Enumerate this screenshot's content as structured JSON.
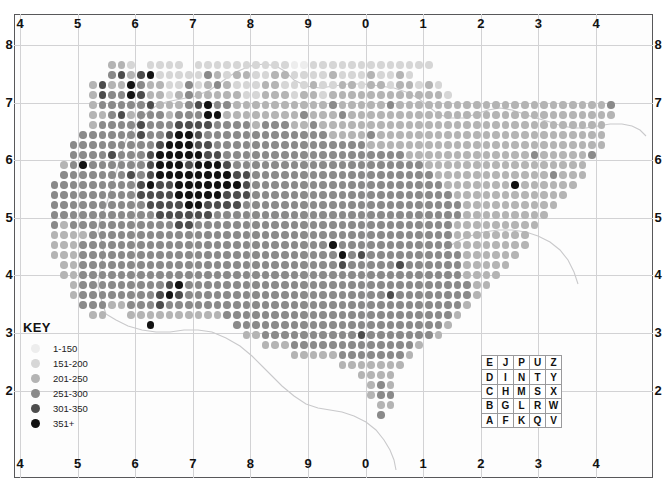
{
  "figure": {
    "background_color": "#ffffff",
    "frame_color": "#58585a",
    "gridline_color": "#d2d2d4",
    "coastline_color": "#c9c9cb"
  },
  "axes": {
    "top_labels": [
      "4",
      "5",
      "6",
      "7",
      "8",
      "9",
      "0",
      "1",
      "2",
      "3",
      "4"
    ],
    "bottom_labels": [
      "4",
      "5",
      "6",
      "7",
      "8",
      "9",
      "0",
      "1",
      "2",
      "3",
      "4"
    ],
    "left_labels": [
      "8",
      "7",
      "6",
      "5",
      "4",
      "3",
      "2"
    ],
    "right_labels": [
      "8",
      "7",
      "6",
      "5",
      "4",
      "3",
      "2"
    ],
    "x_gridline_count": 11,
    "y_gridline_count": 7
  },
  "key": {
    "title": "KEY",
    "classes": [
      {
        "label": "1-150",
        "color": "#ededed",
        "min": 1,
        "max": 150
      },
      {
        "label": "151-200",
        "color": "#d6d6d6",
        "min": 151,
        "max": 200
      },
      {
        "label": "201-250",
        "color": "#b4b4b4",
        "min": 201,
        "max": 250
      },
      {
        "label": "251-300",
        "color": "#8a8a8a",
        "min": 251,
        "max": 300
      },
      {
        "label": "301-350",
        "color": "#4d4d4d",
        "min": 301,
        "max": 350
      },
      {
        "label": "351+",
        "color": "#121212",
        "min": 351,
        "max": null
      }
    ]
  },
  "letter_grid": {
    "caption": "Ordnance Survey 100km letter grid",
    "rows": [
      [
        "E",
        "J",
        "P",
        "U",
        "Z"
      ],
      [
        "D",
        "I",
        "N",
        "T",
        "Y"
      ],
      [
        "C",
        "H",
        "M",
        "S",
        "X"
      ],
      [
        "B",
        "G",
        "L",
        "R",
        "W"
      ],
      [
        "A",
        "F",
        "K",
        "Q",
        "V"
      ]
    ]
  },
  "chart_data": {
    "type": "heatmap",
    "xlabel": "",
    "ylabel": "",
    "grid": true,
    "legend_position": "bottom-left",
    "categories": [
      "1-150",
      "151-200",
      "201-250",
      "251-300",
      "301-350",
      "351+"
    ],
    "class_colors": [
      "#ededed",
      "#d6d6d6",
      "#b4b4b4",
      "#8a8a8a",
      "#4d4d4d",
      "#121212"
    ],
    "x_tick_labels": [
      "4",
      "5",
      "6",
      "7",
      "8",
      "9",
      "0",
      "1",
      "2",
      "3",
      "4"
    ],
    "y_tick_labels": [
      "8",
      "7",
      "6",
      "5",
      "4",
      "3",
      "2"
    ],
    "cell_pitch_px": 9.6,
    "dot_diameter_px": 7.6,
    "note": "Each dot is a 10km grid square shaded by class index 0-5 (0 = 1-150 lightest, 5 = 351+ darkest). Rows are given as run-length strings: each entry is 'col:classIndex'.",
    "rows": [
      {
        "y": 51,
        "dots": "10:2 11:2 12:1 14:1 15:1 16:1 17:1 19:1 20:1 21:1 22:1 23:1 24:1 25:1 26:1 27:1 28:1 29:0 30:0 31:1 32:1 33:1 34:1 35:1 36:1 37:1 38:1 39:1 40:1 41:1 42:1 43:1"
      },
      {
        "y": 61,
        "dots": "10:3 11:4 12:2 13:4 14:5 15:1 16:1 17:1 18:1 19:1 20:3 21:2 22:1 23:2 24:2 25:1 26:1 27:2 28:2 29:1 30:1 31:1 32:1 33:2 34:1 35:1 36:1 37:2 38:1 39:1 40:2 41:1"
      },
      {
        "y": 71,
        "dots": "8:2 9:4 10:2 11:2 12:5 13:3 14:2 15:2 16:1 17:1 18:3 19:1 20:2 21:3 22:2 23:1 24:1 25:1 26:2 27:2 28:1 29:1 30:1 31:2 32:1 33:1 34:2 35:2 36:1 37:2 38:2 39:1 40:2 41:2 42:1 43:2 44:1"
      },
      {
        "y": 81,
        "dots": "8:2 9:4 10:3 11:3 12:5 13:4 14:2 15:2 16:1 17:2 18:3 19:2 20:2 21:2 22:2 23:2 24:1 25:1 26:2 27:2 28:2 29:1 30:2 31:2 32:1 33:2 34:2 35:2 36:2 37:2 38:2 39:2 40:2 41:2 42:2 43:2 44:2 45:1"
      },
      {
        "y": 91,
        "dots": "8:2 9:3 10:3 11:3 12:3 13:3 14:4 15:2 16:2 17:2 18:3 19:4 20:5 21:3 22:3 23:2 24:2 25:2 26:2 27:2 28:2 29:2 30:2 31:2 32:2 33:3 34:2 35:2 36:2 37:2 38:2 39:3 40:2 41:2 42:2 43:2 44:2 45:2 46:2 47:2 48:2 49:2 50:2 51:2 52:2 53:2 54:2 55:2 56:2 57:2 58:2 59:2 60:2 61:2 62:3"
      },
      {
        "y": 101,
        "dots": "8:2 9:2 10:3 11:4 12:2 13:3 14:3 15:3 16:2 17:3 18:3 19:3 20:5 21:5 22:2 23:2 24:2 25:2 26:2 27:2 28:2 29:2 30:3 31:2 32:2 33:2 34:3 35:2 36:2 37:2 38:2 39:2 40:2 41:2 42:2 43:2 44:2 45:2 46:2 47:2 48:2 49:2 50:2 51:2 52:2 53:2 54:2 55:2 56:2 57:2 58:2 59:2 60:2 61:2 62:2"
      },
      {
        "y": 111,
        "dots": "8:2 9:3 10:3 11:3 12:3 13:4 14:3 15:3 16:3 17:4 18:4 19:4 20:4 21:3 22:3 23:3 24:3 25:2 26:3 27:3 28:3 29:2 30:2 31:3 32:2 33:2 34:2 35:2 36:2 37:2 38:2 39:2 40:2 41:2 42:2 43:2 44:2 45:2 46:2 47:2 48:2 49:2 50:2 51:2 52:2 53:2 54:2 55:2 56:2 57:2 58:2 59:2 60:2 61:2"
      },
      {
        "y": 121,
        "dots": "7:3 8:3 9:3 10:3 11:3 12:3 13:4 14:3 15:3 16:4 17:5 18:5 19:4 20:3 21:3 22:3 23:3 24:3 25:3 26:3 27:3 28:3 29:3 30:3 31:3 32:3 33:2 34:2 35:2 36:2 37:3 38:2 39:2 40:2 41:2 42:2 43:2 44:2 45:2 46:2 47:2 48:2 49:2 50:2 51:2 52:2 53:2 54:2 55:2 56:2 57:2 58:2 59:2 60:2 61:2"
      },
      {
        "y": 131,
        "dots": "6:3 7:3 8:3 9:3 10:3 11:3 12:3 13:3 14:3 15:4 16:5 17:5 18:5 19:4 20:4 21:3 22:3 23:3 24:3 25:3 26:3 27:3 28:3 29:3 30:3 31:3 32:3 33:3 34:3 35:3 36:3 37:2 38:2 39:2 40:2 41:2 42:2 43:2 44:2 45:2 46:2 47:2 48:2 49:2 50:2 51:2 52:2 53:2 54:2 55:2 56:2 57:2 58:2 59:2 60:2 61:2"
      },
      {
        "y": 141,
        "dots": "6:3 7:3 8:3 9:3 10:4 11:3 12:3 13:3 14:4 15:5 16:5 17:5 18:5 19:5 20:4 21:4 22:3 23:3 24:3 25:3 26:3 27:3 28:3 29:3 30:3 31:3 32:3 33:3 34:3 35:3 36:3 37:3 38:3 39:3 40:3 41:2 42:2 43:2 44:2 45:2 46:2 47:2 48:2 49:2 50:2 51:2 52:2 53:2 54:3 55:2 56:2 57:2 58:2 59:2 60:3"
      },
      {
        "y": 151,
        "dots": "5:2 6:3 7:5 8:3 9:3 10:3 11:3 12:3 13:3 14:4 15:5 16:5 17:5 18:4 19:5 20:5 21:5 22:4 23:3 24:3 25:3 26:3 27:3 28:3 29:3 30:3 31:3 32:3 33:3 34:3 35:3 36:3 37:3 38:3 39:3 40:3 41:3 42:3 43:2 44:2 45:2 46:2 47:2 48:2 49:2 50:2 51:2 52:2 53:2 54:2 55:2 56:2 57:2 58:2 59:2"
      },
      {
        "y": 161,
        "dots": "5:3 6:3 7:3 8:3 9:3 10:3 11:3 12:4 13:3 14:4 15:5 16:5 17:5 18:5 19:5 20:5 21:5 22:5 23:4 24:4 25:3 26:3 27:3 28:3 29:3 30:3 31:3 32:3 33:3 34:3 35:3 36:3 37:3 38:3 39:3 40:3 41:3 42:3 43:3 44:2 45:2 46:2 47:2 48:2 49:2 50:2 51:2 52:2 53:2 54:2 55:2 56:3 57:2 58:2 59:2"
      },
      {
        "y": 171,
        "dots": "4:3 5:3 6:3 7:3 8:3 9:3 10:3 11:3 12:3 13:4 14:5 15:4 16:4 17:5 18:5 19:5 20:5 21:5 22:5 23:5 24:4 25:3 26:3 27:3 28:3 29:3 30:3 31:3 32:3 33:3 34:3 35:3 36:3 37:3 38:3 39:3 40:3 41:3 42:3 43:3 44:3 45:2 46:2 47:2 48:2 49:2 50:2 51:2 52:5 53:2 54:2 55:2 56:2 57:2 58:2"
      },
      {
        "y": 181,
        "dots": "4:3 5:3 6:3 7:3 8:3 9:3 10:3 11:3 12:3 13:4 14:4 15:4 16:4 17:5 18:5 19:5 20:5 21:5 22:4 23:4 24:4 25:3 26:3 27:3 28:3 29:3 30:3 31:3 32:3 33:3 34:3 35:3 36:3 37:3 38:3 39:3 40:3 41:3 42:3 43:3 44:3 45:3 46:2 47:2 48:2 49:2 50:2 51:2 52:2 53:2 54:2 55:2 56:2 57:2"
      },
      {
        "y": 191,
        "dots": "4:3 5:3 6:3 7:3 8:3 9:3 10:3 11:3 12:3 13:3 14:4 15:4 16:4 17:4 18:5 19:5 20:4 21:4 22:4 23:4 24:3 25:3 26:3 27:3 28:3 29:3 30:3 31:3 32:3 33:3 34:3 35:3 36:3 37:3 38:3 39:3 40:3 41:3 42:3 43:3 44:3 45:3 46:3 47:2 48:2 49:2 50:2 51:2 52:2 53:2 54:2 55:2 56:2"
      },
      {
        "y": 201,
        "dots": "4:3 5:3 6:3 7:3 8:3 9:3 10:3 11:3 12:3 13:3 14:3 15:4 16:4 17:4 18:4 19:4 20:4 21:3 22:3 23:3 24:3 25:3 26:3 27:3 28:3 29:3 30:3 31:3 32:3 33:3 34:3 35:3 36:3 37:3 38:3 39:3 40:3 41:3 42:3 43:3 44:3 45:3 46:3 47:2 48:2 49:2 50:2 51:2 52:2 53:2 54:2 55:2"
      },
      {
        "y": 211,
        "dots": "4:3 5:2 6:3 7:3 8:3 9:3 10:3 11:3 12:3 13:3 14:3 15:3 16:3 17:4 18:4 19:3 20:3 21:3 22:3 23:3 24:3 25:3 26:3 27:3 28:3 29:3 30:3 31:3 32:3 33:3 34:3 35:3 36:3 37:3 38:3 39:3 40:3 41:3 42:3 43:3 44:3 45:3 46:2 47:2 48:2 49:2 50:2 51:2 52:2 53:2 54:2"
      },
      {
        "y": 221,
        "dots": "4:2 5:2 6:2 7:2 8:3 9:3 10:3 11:3 12:3 13:3 14:3 15:3 16:3 17:3 18:3 19:3 20:3 21:3 22:3 23:3 24:3 25:3 26:3 27:3 28:3 29:3 30:3 31:3 32:3 33:3 34:3 35:3 36:3 37:3 38:3 39:3 40:3 41:3 42:3 43:3 44:3 45:3 46:2 47:2 48:2 49:2 50:2 51:2 52:2 53:2"
      },
      {
        "y": 231,
        "dots": "4:2 5:2 6:2 7:3 8:3 9:3 10:3 11:3 12:3 13:3 14:3 15:3 16:3 17:3 18:3 19:3 20:3 21:3 22:3 23:3 24:3 25:3 26:3 27:3 28:3 29:3 30:3 31:3 32:3 33:5 34:3 35:3 36:3 37:3 38:3 39:3 40:3 41:3 42:3 43:3 44:3 45:3 46:2 47:2 48:2 49:2 50:2 51:2 52:2 53:2"
      },
      {
        "y": 241,
        "dots": "4:2 5:2 6:2 7:3 8:3 9:3 10:3 11:3 12:3 13:3 14:3 15:3 16:3 17:3 18:3 19:3 20:3 21:3 22:3 23:3 24:3 25:3 26:3 27:3 28:3 29:3 30:3 31:3 32:3 33:3 34:5 35:3 36:4 37:3 38:3 39:3 40:3 41:3 42:3 43:3 44:3 45:3 46:3 47:2 48:2 49:2 50:2 51:2 52:2"
      },
      {
        "y": 251,
        "dots": "5:2 6:2 7:3 8:3 9:3 10:3 11:3 12:3 13:3 14:3 15:3 16:3 17:3 18:3 19:3 20:3 21:3 22:3 23:3 24:3 25:3 26:3 27:3 28:3 29:3 30:3 31:3 32:3 33:3 34:4 35:3 36:3 37:3 38:3 39:3 40:4 41:3 42:3 43:3 44:3 45:3 46:3 47:2 48:2 49:2 50:2 51:2"
      },
      {
        "y": 261,
        "dots": "5:2 6:2 7:3 8:3 9:3 10:3 11:3 12:3 13:3 14:3 15:3 16:3 17:3 18:3 19:3 20:3 21:3 22:3 23:3 24:3 25:3 26:3 27:3 28:3 29:3 30:3 31:3 32:3 33:3 34:3 35:3 36:3 37:3 38:3 39:3 40:3 41:3 42:3 43:3 44:3 45:3 46:3 47:2 48:2 49:2 50:2"
      },
      {
        "y": 271,
        "dots": "6:2 7:3 8:3 9:3 10:3 11:3 12:3 13:3 14:3 15:3 16:4 17:5 18:3 19:3 20:3 21:3 22:3 23:3 24:3 25:3 26:3 27:3 28:3 29:3 30:3 31:3 32:3 33:3 34:3 35:3 36:3 37:3 38:3 39:3 40:3 41:3 42:3 43:3 44:3 45:3 46:3 47:3 48:2 49:2"
      },
      {
        "y": 281,
        "dots": "6:2 7:3 8:3 9:3 10:3 11:3 12:3 13:3 14:3 15:4 16:5 17:4 18:3 19:3 20:3 21:3 22:3 23:3 24:3 25:3 26:3 27:3 28:3 29:3 30:3 31:3 32:3 33:3 34:3 35:3 36:3 37:3 38:3 39:4 40:3 41:3 42:3 43:3 44:3 45:3 46:3 47:3 48:2"
      },
      {
        "y": 291,
        "dots": "7:3 8:3 9:3 10:2 11:2 12:3 13:3 14:3 15:4 16:3 17:3 18:3 19:3 20:3 21:3 22:3 23:3 24:3 25:3 26:3 27:3 28:3 29:3 30:3 31:3 32:3 33:3 34:3 35:3 36:3 37:3 38:3 39:3 40:3 41:3 42:3 43:3 44:3 45:3 46:3 47:2"
      },
      {
        "y": 301,
        "dots": "8:2 9:2 12:2 13:2 14:2 15:2 16:2 17:2 18:2 19:2 20:2 21:2 22:3 23:3 24:3 25:3 26:3 27:3 28:3 29:3 30:3 31:3 32:3 33:3 34:3 35:3 36:3 37:3 38:3 39:3 40:3 41:3 42:3 43:3 44:3 45:3 46:2"
      },
      {
        "y": 311,
        "dots": "14:5 23:3 24:3 25:3 26:3 27:3 28:3 29:3 30:3 31:3 32:3 33:3 34:3 35:3 36:3 37:3 38:3 39:3 40:3 41:3 42:3 43:3 44:3 45:2"
      },
      {
        "y": 321,
        "dots": "24:2 25:2 26:3 27:3 28:3 29:3 30:3 31:3 32:3 33:3 34:3 35:3 36:4 37:3 38:3 39:3 40:3 41:3 42:3 43:3 44:2"
      },
      {
        "y": 331,
        "dots": "26:2 27:2 28:2 29:3 30:3 31:3 32:3 33:3 34:3 35:3 36:3 37:3 38:3 39:3 40:3 41:3 42:2"
      },
      {
        "y": 341,
        "dots": "29:2 30:2 31:2 32:2 33:2 34:3 35:3 36:3 37:3 38:3 39:3 40:3 41:2"
      },
      {
        "y": 351,
        "dots": "34:2 35:2 36:2 37:2 38:2 39:2 40:2"
      },
      {
        "y": 361,
        "dots": "36:2 37:2 38:2 39:2"
      },
      {
        "y": 371,
        "dots": "37:2 38:3 39:2"
      },
      {
        "y": 381,
        "dots": "37:2 38:3 39:3"
      },
      {
        "y": 391,
        "dots": "38:2 39:2"
      },
      {
        "y": 401,
        "dots": "38:3"
      }
    ]
  }
}
